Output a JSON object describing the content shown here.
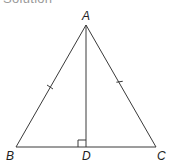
{
  "heading": "Solution",
  "diagram": {
    "type": "isosceles-triangle-with-altitude",
    "points": {
      "A": {
        "label": "A",
        "x": 86,
        "y": 25
      },
      "B": {
        "label": "B",
        "x": 16,
        "y": 147
      },
      "C": {
        "label": "C",
        "x": 156,
        "y": 147
      },
      "D": {
        "label": "D",
        "x": 86,
        "y": 147
      }
    },
    "segments": [
      "AB",
      "AC",
      "BC",
      "AD"
    ],
    "equal_marks": [
      "AB",
      "AC"
    ],
    "right_angle_at": "D",
    "stroke_color": "#3a3a3a"
  }
}
